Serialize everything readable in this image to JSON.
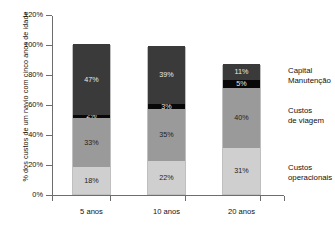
{
  "chart_data": {
    "type": "bar",
    "subtype": "stacked-vertical",
    "title": "",
    "xlabel": "",
    "ylabel": "% dos custos de um navio com cinco anos de idade",
    "categories": [
      "5 anos",
      "10 anos",
      "20 anos"
    ],
    "ylim": [
      0,
      120
    ],
    "ytick_values": [
      0,
      20,
      40,
      60,
      80,
      100,
      120
    ],
    "ytick_labels": [
      "0%",
      "20%",
      "40%",
      "60%",
      "80%",
      "100%",
      "120%"
    ],
    "grid": false,
    "legend_position": "right",
    "stack_order_bottom_to_top": [
      "Custos operacionais",
      "Custos de viagem",
      "Manutenção",
      "Capital"
    ],
    "series": [
      {
        "name": "Custos operacionais",
        "color": "#cfcfcf",
        "values": [
          18,
          22,
          31
        ],
        "labels": [
          "18%",
          "22%",
          "31%"
        ]
      },
      {
        "name": "Custos de viagem",
        "color": "#9a9a9a",
        "values": [
          33,
          35,
          40
        ],
        "labels": [
          "33%",
          "35%",
          "40%"
        ]
      },
      {
        "name": "Manutenção",
        "color": "#080808",
        "values": [
          2,
          3,
          5
        ],
        "labels": [
          "2%",
          "3%",
          "5%"
        ]
      },
      {
        "name": "Capital",
        "color": "#3a3a3a",
        "values": [
          47,
          39,
          11
        ],
        "labels": [
          "47%",
          "39%",
          "11%"
        ]
      }
    ],
    "totals": [
      100,
      99,
      87
    ]
  },
  "legend": {
    "entries": [
      {
        "line1": "Capital",
        "line2": "Manutenção"
      },
      {
        "line1": "Custos",
        "line2": "de viagem"
      },
      {
        "line1": "Custos",
        "line2": "operacionais"
      }
    ]
  }
}
